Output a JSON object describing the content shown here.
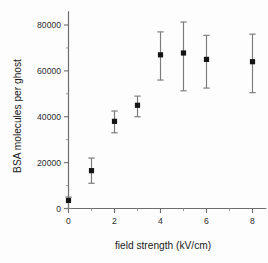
{
  "chart_data": {
    "type": "scatter",
    "title": "",
    "xlabel": "field strength (kV/cm)",
    "ylabel": "BSA molecules per ghost",
    "xlim": [
      -0.35,
      8.6
    ],
    "ylim": [
      0,
      86000
    ],
    "grid": false,
    "legend": "none",
    "marker": "filled-square",
    "errorbars": true,
    "x": [
      0,
      1,
      2,
      3,
      4,
      5,
      6,
      8
    ],
    "values": [
      3500,
      16500,
      38000,
      45000,
      67000,
      67800,
      65000,
      64000
    ],
    "yerr_low": [
      3500,
      5500,
      5000,
      5000,
      11000,
      16500,
      12500,
      13500
    ],
    "yerr_high": [
      1500,
      5500,
      4500,
      4000,
      10000,
      13500,
      10500,
      12000
    ],
    "points": [
      {
        "x": 0,
        "y": 3500,
        "low": 0,
        "high": 5000
      },
      {
        "x": 1,
        "y": 16500,
        "low": 11000,
        "high": 22000
      },
      {
        "x": 2,
        "y": 38000,
        "low": 33000,
        "high": 42500
      },
      {
        "x": 3,
        "y": 45000,
        "low": 40000,
        "high": 49000
      },
      {
        "x": 4,
        "y": 67000,
        "low": 56000,
        "high": 77000
      },
      {
        "x": 5,
        "y": 67800,
        "low": 51300,
        "high": 81300
      },
      {
        "x": 6,
        "y": 65000,
        "low": 52500,
        "high": 75500
      },
      {
        "x": 8,
        "y": 64000,
        "low": 50500,
        "high": 76000
      }
    ],
    "xticks": [
      0,
      2,
      4,
      6,
      8
    ],
    "xticklabels": [
      "0",
      "2",
      "4",
      "6",
      "8"
    ],
    "xminorticks": [
      1,
      3,
      5,
      7
    ],
    "yticks": [
      0,
      20000,
      40000,
      60000,
      80000
    ],
    "yticklabels": [
      "0",
      "20000",
      "40000",
      "60000",
      "80000"
    ],
    "yminorticks": [
      10000,
      30000,
      50000,
      70000
    ],
    "colors": {
      "marker": "#141414",
      "errorbar": "#7a7a7a",
      "axis": "#6d6d6d",
      "text": "#1b1b1b",
      "background": "#fdfdfd"
    }
  }
}
